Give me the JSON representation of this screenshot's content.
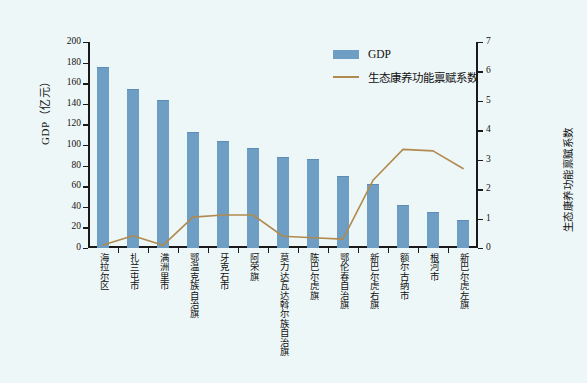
{
  "chart_data": {
    "type": "bar",
    "title": "",
    "xlabel": "",
    "ylabel": "GDP（亿元）",
    "ylabel_right": "生态康养功能禀赋系数",
    "ylim": [
      0,
      200
    ],
    "ylim_right": [
      0,
      7
    ],
    "yticks": [
      0,
      20,
      40,
      60,
      80,
      100,
      120,
      140,
      160,
      180,
      200
    ],
    "yticks_right": [
      0,
      1,
      2,
      3,
      4,
      5,
      6,
      7
    ],
    "grid": false,
    "legend_position": "top-right",
    "categories": [
      "海拉尔区",
      "扎兰屯市",
      "满洲里市",
      "鄂温克族自治旗",
      "牙克石市",
      "阿荣旗",
      "莫力达瓦达斡尔族自治旗",
      "陈巴尔虎旗",
      "鄂伦春自治旗",
      "新巴尔虎右旗",
      "额尔古纳市",
      "根河市",
      "新巴尔虎左旗"
    ],
    "series": [
      {
        "name": "GDP",
        "type": "bar",
        "axis": "left",
        "color": "#6e9ec4",
        "values": [
          175,
          153,
          143,
          112,
          103,
          96,
          87,
          85,
          69,
          61,
          41,
          34,
          26
        ]
      },
      {
        "name": "生态康养功能禀赋系数",
        "type": "line",
        "axis": "right",
        "color": "#b08a4e",
        "values": [
          0.1,
          0.42,
          0.09,
          1.05,
          1.12,
          1.12,
          0.4,
          0.35,
          0.3,
          2.3,
          3.35,
          3.3,
          2.7
        ]
      }
    ]
  },
  "legend": {
    "items": [
      {
        "label": "GDP",
        "marker": "bar-swatch",
        "color": "#6e9ec4"
      },
      {
        "label": "生态康养功能禀赋系数",
        "marker": "line-swatch",
        "color": "#b08a4e"
      }
    ]
  },
  "figure": {
    "background_color": "#eef7f8",
    "axis_color": "#1a1a1a"
  }
}
